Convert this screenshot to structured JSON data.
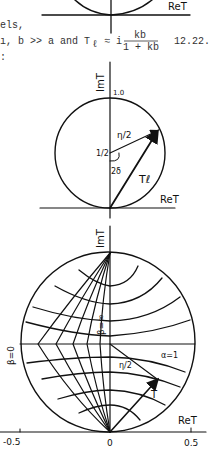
{
  "text": {
    "line1": "els,",
    "line2_a": "ı, b >> a  and  T",
    "line2_sub": "ℓ",
    "line2_approx": "≈ i",
    "fraction_num": "kb",
    "fraction_den": "1 + kb",
    "equation_number": "12.22.",
    "line3": ":"
  },
  "figure_top": {
    "axis_label": "ReT"
  },
  "figure_middle": {
    "y_axis_label": "ImT",
    "top_tick": "1.0",
    "center_label": "1/2",
    "radius_label": "η/2",
    "angle_label": "2δ",
    "vector_label": "Tℓ",
    "x_axis_label": "ReT"
  },
  "figure_bottom": {
    "y_axis_label": "ImT",
    "beta_zero_label": "β=0",
    "beta_inf_label": "β=∞",
    "alpha_label": "α=1",
    "radius_label": "η/2",
    "vector_label": "T",
    "x_axis_label": "ReT",
    "x_ticks": [
      "-0.5",
      "0",
      "0.5"
    ]
  }
}
